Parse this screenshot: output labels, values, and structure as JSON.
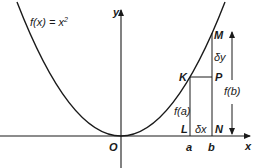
{
  "diagram": {
    "function_label": "f(x) = x",
    "function_exponent": "2",
    "axes": {
      "x_label": "x",
      "y_label": "y",
      "origin_label": "O"
    },
    "points": {
      "K": "K",
      "M": "M",
      "P": "P",
      "L": "L",
      "N": "N"
    },
    "ticks": {
      "a": "a",
      "b": "b"
    },
    "measures": {
      "delta_y": "δy",
      "delta_x": "δx",
      "f_a": "f(a)",
      "f_b": "f(b)"
    },
    "colors": {
      "line": "#1a1a1a",
      "background": "#ffffff"
    }
  }
}
